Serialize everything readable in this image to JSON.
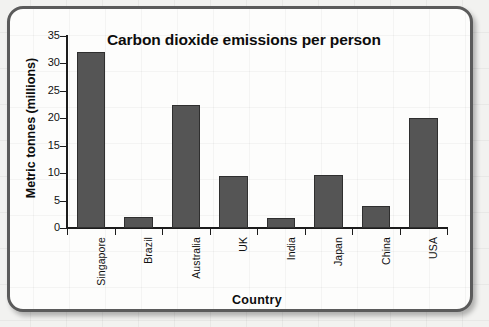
{
  "figure": {
    "frame_border_color": "#5b5b5b",
    "background_color": "#fdfdfc"
  },
  "chart_data": {
    "type": "bar",
    "title": "Carbon dioxide emissions per person",
    "xlabel": "Country",
    "ylabel": "Metric tonnes (millions)",
    "categories": [
      "Singapore",
      "Brazil",
      "Australia",
      "UK",
      "India",
      "Japan",
      "China",
      "USA"
    ],
    "values": [
      32,
      2,
      22.5,
      9.5,
      1.8,
      9.6,
      4,
      20
    ],
    "ylim": [
      0,
      35
    ],
    "y_ticks": [
      0,
      5,
      10,
      15,
      20,
      25,
      30,
      35
    ],
    "y_tick_labels": [
      "0",
      "5",
      "10",
      "15",
      "20",
      "25",
      "30",
      "35"
    ],
    "grid": false,
    "legend": "none",
    "bar_color": "#555555",
    "bar_border_color": "#2f2f2f",
    "axis_color": "#1c1c1c"
  }
}
